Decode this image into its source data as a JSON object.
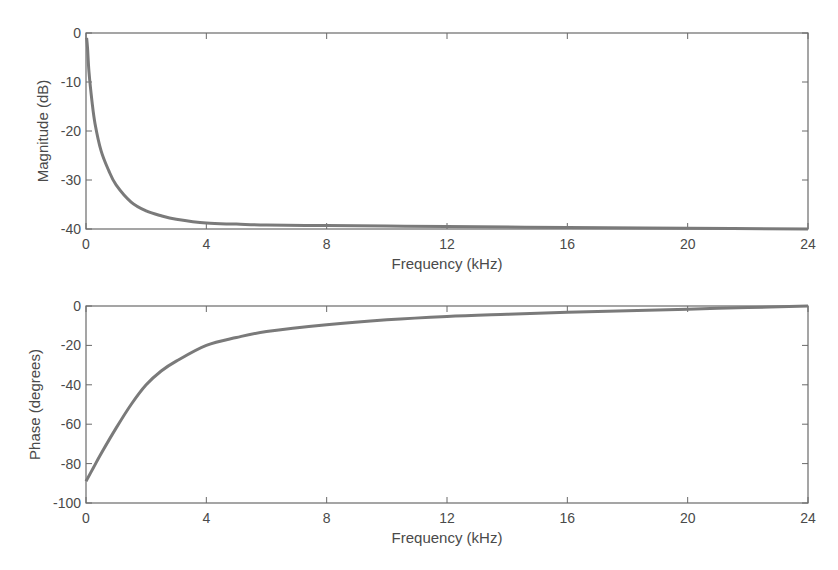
{
  "chart_data": [
    {
      "type": "line",
      "title": "",
      "xlabel": "Frequency (kHz)",
      "ylabel": "Magnitude (dB)",
      "xlim": [
        0,
        24
      ],
      "ylim": [
        -40,
        0
      ],
      "xticks": [
        0,
        4,
        8,
        12,
        16,
        20,
        24
      ],
      "yticks": [
        0,
        -10,
        -20,
        -30,
        -40
      ],
      "grid": false,
      "series": [
        {
          "name": "magnitude",
          "x": [
            0.02,
            0.05,
            0.1,
            0.2,
            0.3,
            0.5,
            0.75,
            1,
            1.5,
            2,
            2.5,
            3,
            4,
            5,
            6,
            8,
            10,
            12,
            16,
            20,
            24
          ],
          "y": [
            -1,
            -3,
            -8,
            -14,
            -18.5,
            -24,
            -28,
            -31,
            -34.5,
            -36.3,
            -37.3,
            -38,
            -38.8,
            -39.0,
            -39.2,
            -39.3,
            -39.4,
            -39.5,
            -39.7,
            -39.85,
            -40
          ]
        }
      ]
    },
    {
      "type": "line",
      "title": "",
      "xlabel": "Frequency (kHz)",
      "ylabel": "Phase (degrees)",
      "xlim": [
        0,
        24
      ],
      "ylim": [
        -100,
        0
      ],
      "xticks": [
        0,
        4,
        8,
        12,
        16,
        20,
        24
      ],
      "yticks": [
        0,
        -20,
        -40,
        -60,
        -80,
        -100
      ],
      "grid": false,
      "series": [
        {
          "name": "phase",
          "x": [
            0,
            0.25,
            0.5,
            1,
            1.5,
            2,
            2.5,
            3,
            4,
            5,
            6,
            8,
            10,
            12,
            14,
            16,
            18,
            20,
            22,
            24
          ],
          "y": [
            -89,
            -82,
            -75,
            -62,
            -50,
            -40,
            -33,
            -28,
            -20,
            -16,
            -13,
            -9.5,
            -7,
            -5.3,
            -4.2,
            -3.2,
            -2.4,
            -1.6,
            -0.8,
            0
          ]
        }
      ]
    }
  ]
}
